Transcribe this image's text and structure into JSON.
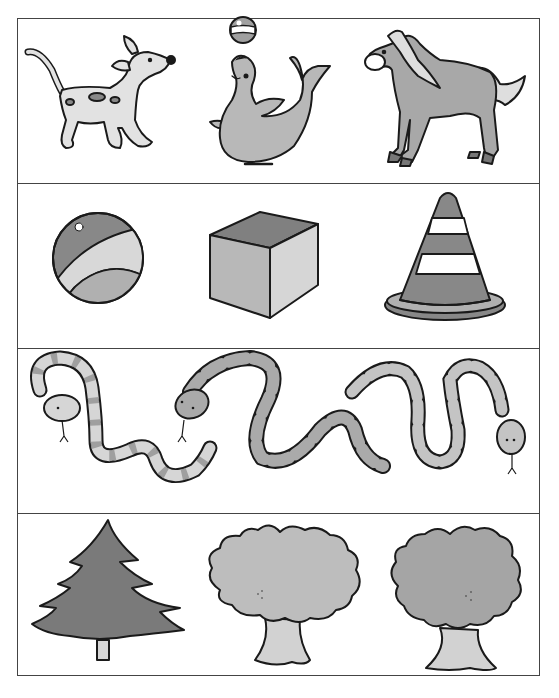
{
  "worksheet": {
    "rows": [
      {
        "name": "animals",
        "items": [
          "dog",
          "seal",
          "horse"
        ]
      },
      {
        "name": "shapes",
        "items": [
          "ball",
          "cube",
          "cone"
        ]
      },
      {
        "name": "snakes",
        "items": [
          "snake",
          "snake",
          "snake"
        ]
      },
      {
        "name": "trees",
        "items": [
          "pine-tree",
          "deciduous-tree",
          "deciduous-tree"
        ]
      }
    ]
  },
  "colors": {
    "ink": "#1a1a1a",
    "white": "#ffffff",
    "light": "#d2d2d2",
    "mid": "#b4b4b4",
    "dark": "#8a8a8a",
    "darker": "#777777",
    "border": "#444444"
  }
}
